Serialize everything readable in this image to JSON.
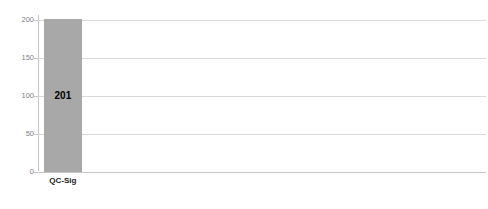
{
  "chart_data": {
    "type": "bar",
    "title": "",
    "categories": [
      "QC-Sig",
      "QC-Seal",
      "QWAC",
      "QTS",
      "ValS-Sig",
      "ValS-Seal",
      "PresS-Sig",
      "PresS-Seal",
      "QeRDS"
    ],
    "values": [
      201,
      93,
      41,
      102,
      13,
      13,
      10,
      11,
      15
    ],
    "xlabel": "",
    "ylabel": "",
    "ylim": [
      0,
      200
    ],
    "yticks": [
      0,
      50,
      100,
      150,
      200
    ],
    "grid": true,
    "legend": "none",
    "bar_color": "#a8a8a8",
    "gridline_color": "#d9d9d9",
    "tick_label_color": "#7f7f7f",
    "value_label_color": "#000000",
    "category_label_color": "#1a1a1a",
    "value_label_positions": [
      "inside-center",
      "inside-center",
      "inside-center",
      "inside-center",
      "above",
      "above",
      "above",
      "above",
      "above"
    ],
    "category_icons": [
      "signature",
      "seal",
      "globe",
      "none",
      "signature",
      "seal",
      "signature",
      "seal",
      "none"
    ],
    "decorative_icons": [
      {
        "name": "certificate",
        "at": 1
      },
      {
        "name": "timestamp-stamp",
        "at": 3
      },
      {
        "name": "magnifier-seal",
        "between": [
          4,
          5
        ]
      },
      {
        "name": "preservation-safe",
        "between": [
          6,
          7
        ]
      },
      {
        "name": "delivery-person",
        "at": 8
      }
    ]
  }
}
